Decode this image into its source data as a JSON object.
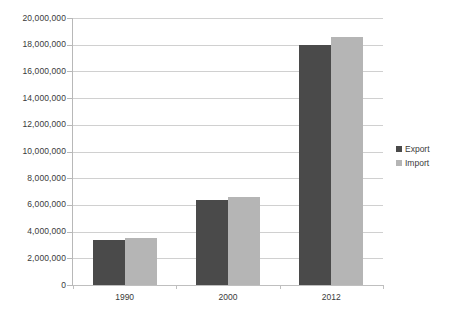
{
  "chart_data": {
    "type": "bar",
    "title": "",
    "subtitle": "",
    "xlabel": "",
    "ylabel": "",
    "categories": [
      "1990",
      "2000",
      "2012"
    ],
    "series": [
      {
        "name": "Export",
        "color": "#4a4a4a",
        "values": [
          3400000,
          6400000,
          17950000
        ]
      },
      {
        "name": "Import",
        "color": "#b5b5b5",
        "values": [
          3500000,
          6600000,
          18600000
        ]
      }
    ],
    "ylim": [
      0,
      20000000
    ],
    "ytick_step": 2000000,
    "ytick_labels": [
      "20,000,000",
      "18,000,000",
      "16,000,000",
      "14,000,000",
      "12,000,000",
      "10,000,000",
      "8,000,000",
      "6,000,000",
      "4,000,000",
      "2,000,000",
      "0"
    ],
    "ytick_values": [
      20000000,
      18000000,
      16000000,
      14000000,
      12000000,
      10000000,
      8000000,
      6000000,
      4000000,
      2000000,
      0
    ],
    "grid": true,
    "legend_position": "right"
  },
  "legend": {
    "items": [
      {
        "label": "Export"
      },
      {
        "label": "Import"
      }
    ]
  }
}
